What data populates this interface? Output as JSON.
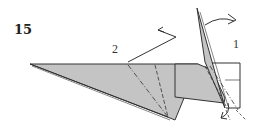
{
  "diagram": {
    "step_number": "15",
    "labels": [
      "2",
      "1"
    ],
    "paper_color": "#c4c4c4",
    "line_color": "#333333"
  }
}
